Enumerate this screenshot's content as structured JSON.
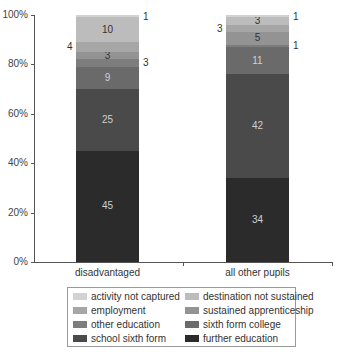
{
  "chart_data": {
    "type": "bar",
    "stacked": true,
    "normalized_percent": true,
    "title": "",
    "xlabel": "",
    "ylabel": "",
    "ylim": [
      0,
      100
    ],
    "y_ticks": [
      "0%",
      "20%",
      "40%",
      "60%",
      "80%",
      "100%"
    ],
    "grid": false,
    "legend_position": "bottom",
    "categories": [
      "disadvantaged",
      "all other pupils"
    ],
    "series": [
      {
        "name": "further education",
        "color": "#2b2b2b",
        "values": [
          45,
          34
        ]
      },
      {
        "name": "school sixth form",
        "color": "#4a4a4a",
        "values": [
          25,
          42
        ]
      },
      {
        "name": "sixth form college",
        "color": "#6a6a6a",
        "values": [
          9,
          11
        ]
      },
      {
        "name": "other education",
        "color": "#7d7d7d",
        "values": [
          3,
          1
        ]
      },
      {
        "name": "sustained apprenticeship",
        "color": "#939393",
        "values": [
          3,
          5
        ]
      },
      {
        "name": "employment",
        "color": "#a6a6a6",
        "values": [
          4,
          3
        ]
      },
      {
        "name": "destination not sustained",
        "color": "#bcbcbc",
        "values": [
          10,
          3
        ]
      },
      {
        "name": "activity not captured",
        "color": "#d2d2d2",
        "values": [
          1,
          1
        ]
      }
    ],
    "legend_entries": [
      "activity not captured",
      "destination not sustained",
      "employment",
      "sustained apprenticeship",
      "other education",
      "sixth form college",
      "school sixth form",
      "further education"
    ]
  }
}
